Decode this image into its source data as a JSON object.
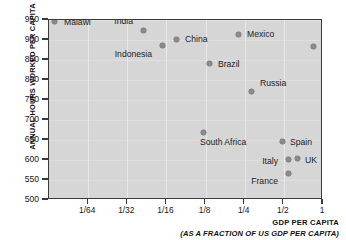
{
  "chart_data": {
    "type": "scatter",
    "title": "",
    "xlabel": "GDP PER CAPITA",
    "xsublabel": "(AS A FRACTION OF US GDP PER CAPITA)",
    "ylabel": "ANNUAL HOURS WORKED PER CAPITA",
    "xscale": "log2",
    "xlim": [
      0.0078125,
      1
    ],
    "ylim": [
      500,
      950
    ],
    "grid": true,
    "legend": "none",
    "xticks": [
      {
        "label": "1/64",
        "value": 0.015625
      },
      {
        "label": "1/32",
        "value": 0.03125
      },
      {
        "label": "1/16",
        "value": 0.0625
      },
      {
        "label": "1/8",
        "value": 0.125
      },
      {
        "label": "1/4",
        "value": 0.25
      },
      {
        "label": "1/2",
        "value": 0.5
      },
      {
        "label": "1",
        "value": 1
      }
    ],
    "yticks": [
      {
        "label": "950",
        "value": 950
      },
      {
        "label": "900",
        "value": 900
      },
      {
        "label": "850",
        "value": 850
      },
      {
        "label": "800",
        "value": 800
      },
      {
        "label": "750",
        "value": 750
      },
      {
        "label": "700",
        "value": 700
      },
      {
        "label": "650",
        "value": 650
      },
      {
        "label": "600",
        "value": 600
      },
      {
        "label": "550",
        "value": 550
      },
      {
        "label": "500",
        "value": 500
      }
    ],
    "points": [
      {
        "name": "Malawi",
        "x": 0.0125,
        "y": 952,
        "px": 53,
        "py": 20,
        "lx": 10,
        "ly": -3,
        "align": "left"
      },
      {
        "name": "India",
        "x": 0.052,
        "y": 930,
        "px": 142,
        "py": 29,
        "lx": -8,
        "ly": -13,
        "align": "right"
      },
      {
        "name": "Indonesia",
        "x": 0.077,
        "y": 908,
        "px": 161,
        "py": 44,
        "lx": -8,
        "ly": 5,
        "align": "right"
      },
      {
        "name": "China",
        "x": 0.095,
        "y": 905,
        "px": 175,
        "py": 38,
        "lx": 9,
        "ly": -4,
        "align": "left"
      },
      {
        "name": "Brazil",
        "x": 0.168,
        "y": 845,
        "px": 208,
        "py": 62,
        "lx": 9,
        "ly": -3,
        "align": "left"
      },
      {
        "name": "Mexico",
        "x": 0.27,
        "y": 918,
        "px": 237,
        "py": 33,
        "lx": 9,
        "ly": -4,
        "align": "left"
      },
      {
        "name": "Russia",
        "x": 0.33,
        "y": 775,
        "px": 250,
        "py": 90,
        "lx": 9,
        "ly": -12,
        "align": "left"
      },
      {
        "name": "USA",
        "x": 1.0,
        "y": 885,
        "px": 312,
        "py": 45,
        "lx": 9,
        "ly": -3,
        "align": "left"
      },
      {
        "name": "South Africa",
        "x": 0.155,
        "y": 655,
        "px": 202,
        "py": 131,
        "lx": -3,
        "ly": 6,
        "align": "left"
      },
      {
        "name": "Spain",
        "x": 0.52,
        "y": 632,
        "px": 281,
        "py": 140,
        "lx": 8,
        "ly": -3,
        "align": "left"
      },
      {
        "name": "Italy",
        "x": 0.58,
        "y": 588,
        "px": 287,
        "py": 158,
        "lx": -8,
        "ly": -2,
        "align": "right"
      },
      {
        "name": "UK",
        "x": 0.66,
        "y": 588,
        "px": 296,
        "py": 157,
        "lx": 8,
        "ly": -2,
        "align": "left"
      },
      {
        "name": "France",
        "x": 0.58,
        "y": 555,
        "px": 287,
        "py": 172,
        "lx": -8,
        "ly": 4,
        "align": "right"
      }
    ]
  }
}
